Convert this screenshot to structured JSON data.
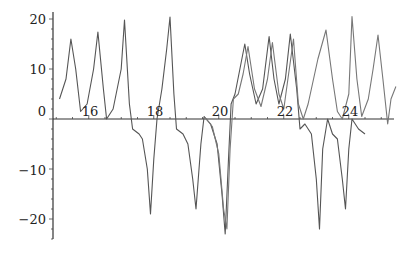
{
  "chart_data": {
    "type": "line",
    "title": "",
    "xlabel": "",
    "ylabel": "",
    "xlim": [
      14.9,
      25.3
    ],
    "ylim": [
      -24,
      21
    ],
    "grid": false,
    "legend": null,
    "x_ticks": [
      "16",
      "18",
      "20",
      "22",
      "24"
    ],
    "y_ticks": [
      "20",
      "10",
      "0",
      "−10",
      "−20"
    ],
    "series": [
      {
        "name": "series-1",
        "color": "#555555",
        "points": [
          [
            15.1,
            4.0
          ],
          [
            15.3,
            8
          ],
          [
            15.45,
            16
          ],
          [
            15.6,
            10
          ],
          [
            15.75,
            1.5
          ],
          [
            15.95,
            3
          ],
          [
            16.15,
            10
          ],
          [
            16.28,
            17.4
          ],
          [
            16.45,
            6
          ],
          [
            16.55,
            0
          ],
          [
            16.75,
            2
          ],
          [
            17.0,
            10
          ],
          [
            17.1,
            19.8
          ],
          [
            17.25,
            3
          ],
          [
            17.35,
            -2
          ],
          [
            17.55,
            -3
          ],
          [
            17.65,
            -4
          ],
          [
            17.8,
            -10
          ],
          [
            17.9,
            -19
          ],
          [
            18.0,
            -8
          ],
          [
            18.1,
            0
          ],
          [
            18.25,
            6
          ],
          [
            18.4,
            14
          ],
          [
            18.5,
            20.4
          ],
          [
            18.62,
            5
          ],
          [
            18.7,
            -2
          ],
          [
            18.9,
            -3
          ],
          [
            19.05,
            -5
          ],
          [
            19.2,
            -12
          ],
          [
            19.3,
            -18
          ],
          [
            19.45,
            -5
          ],
          [
            19.55,
            0.5
          ],
          [
            19.75,
            -1
          ],
          [
            19.95,
            -5
          ],
          [
            20.1,
            -15
          ],
          [
            20.2,
            -23
          ],
          [
            20.3,
            -8
          ],
          [
            20.38,
            3
          ],
          [
            20.5,
            5
          ],
          [
            20.65,
            10
          ],
          [
            20.8,
            15
          ],
          [
            20.95,
            9
          ],
          [
            21.15,
            3
          ],
          [
            21.35,
            6
          ],
          [
            21.55,
            16.5
          ],
          [
            21.7,
            8
          ],
          [
            21.85,
            3
          ],
          [
            22.05,
            8
          ],
          [
            22.2,
            17
          ],
          [
            22.4,
            6
          ],
          [
            22.5,
            -2
          ],
          [
            22.65,
            -1
          ],
          [
            22.85,
            -3
          ],
          [
            23.0,
            -12
          ],
          [
            23.1,
            -22
          ],
          [
            23.2,
            -6
          ],
          [
            23.35,
            0
          ],
          [
            23.5,
            -3
          ],
          [
            23.65,
            -4
          ],
          [
            23.8,
            -12
          ],
          [
            23.9,
            -18
          ],
          [
            24.0,
            -6
          ],
          [
            24.1,
            0
          ],
          [
            24.3,
            -2
          ],
          [
            24.5,
            -3
          ]
        ]
      },
      {
        "name": "series-2",
        "color": "#777777",
        "points": [
          [
            19.55,
            0.5
          ],
          [
            19.8,
            -1.5
          ],
          [
            20.0,
            -7
          ],
          [
            20.15,
            -18
          ],
          [
            20.25,
            -22
          ],
          [
            20.35,
            -6
          ],
          [
            20.45,
            4
          ],
          [
            20.6,
            5
          ],
          [
            20.75,
            9
          ],
          [
            20.9,
            14.5
          ],
          [
            21.1,
            6
          ],
          [
            21.3,
            2.5
          ],
          [
            21.5,
            8
          ],
          [
            21.65,
            15.3
          ],
          [
            21.85,
            5
          ],
          [
            22.0,
            2
          ],
          [
            22.15,
            9
          ],
          [
            22.3,
            16
          ],
          [
            22.45,
            3
          ],
          [
            22.6,
            0
          ],
          [
            22.75,
            3
          ],
          [
            23.05,
            12
          ],
          [
            23.3,
            17.8
          ],
          [
            23.5,
            8
          ],
          [
            23.65,
            1.5
          ],
          [
            23.8,
            0
          ],
          [
            24.0,
            5
          ],
          [
            24.1,
            20.5
          ],
          [
            24.25,
            8
          ],
          [
            24.4,
            0.5
          ],
          [
            24.6,
            4
          ],
          [
            24.75,
            10
          ],
          [
            24.9,
            16.8
          ],
          [
            25.05,
            8
          ],
          [
            25.2,
            -1
          ],
          [
            25.3,
            4
          ],
          [
            25.45,
            6.5
          ]
        ]
      }
    ]
  },
  "axes": {
    "x_tick_labels": [
      "16",
      "18",
      "20",
      "22",
      "24"
    ],
    "y_tick_labels": [
      "20",
      "10",
      "0",
      "−10",
      "−20"
    ]
  }
}
